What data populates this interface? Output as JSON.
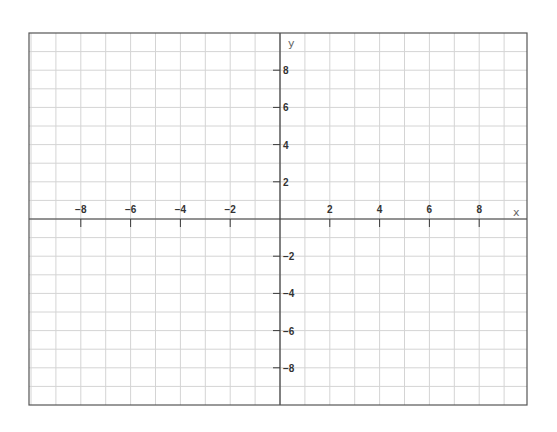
{
  "chart_data": {
    "type": "line",
    "title": "",
    "xlabel": "x",
    "ylabel": "y",
    "xlim": [
      -10,
      10
    ],
    "ylim": [
      -10,
      10
    ],
    "grid": true,
    "grid_step": 1,
    "x_ticks": [
      -8,
      -6,
      -4,
      -2,
      2,
      4,
      6,
      8
    ],
    "y_ticks": [
      8,
      6,
      4,
      2,
      -2,
      -4,
      -6,
      -8
    ],
    "x_tick_labels": [
      "−8",
      "−6",
      "−4",
      "−2",
      "2",
      "4",
      "6",
      "8"
    ],
    "y_tick_labels": [
      "8",
      "6",
      "4",
      "2",
      "−2",
      "−4",
      "−6",
      "−8"
    ],
    "series": [],
    "legend": null
  },
  "layout": {
    "frame": {
      "left": 29,
      "top": 33,
      "right": 527,
      "bottom": 405
    },
    "origin": {
      "x": 280,
      "y": 219
    },
    "unit_x": 24.9,
    "unit_y": 18.6
  },
  "colors": {
    "grid": "#d4d4d4",
    "axis": "#3a3a3a",
    "frame": "#555555",
    "label": "#333333"
  }
}
